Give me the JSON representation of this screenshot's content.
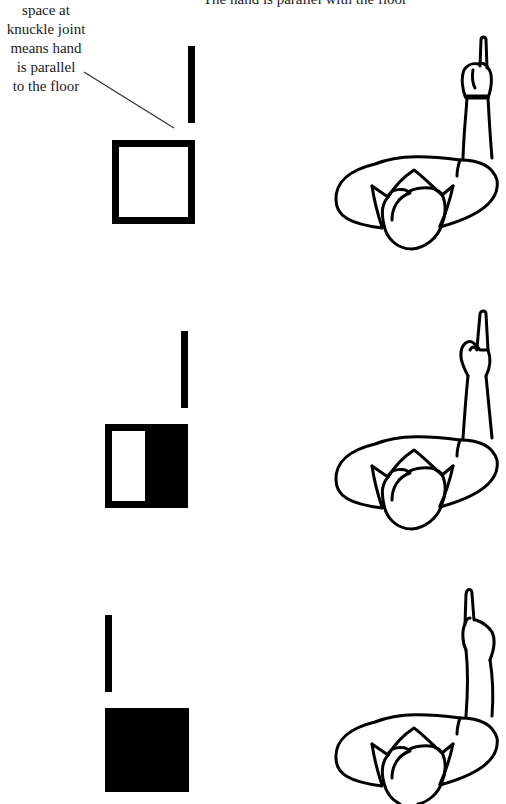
{
  "diagram": {
    "title": "The hand is parallel with the floor",
    "annotation": {
      "lines": [
        "space at",
        "knuckle joint",
        "means hand",
        "is parallel",
        "to the floor"
      ]
    },
    "panels": [
      {
        "id": "panel-1",
        "indicator": {
          "bar_position": "right",
          "square_state": "empty-outline"
        },
        "figure": {
          "pose": "arm raised, index finger pointing up, fist closed",
          "hand_orientation": "parallel to floor"
        }
      },
      {
        "id": "panel-2",
        "indicator": {
          "bar_position": "right",
          "square_state": "half-filled"
        },
        "figure": {
          "pose": "arm raised, index finger pointing up, hand tilted",
          "hand_orientation": "tilted"
        }
      },
      {
        "id": "panel-3",
        "indicator": {
          "bar_position": "left",
          "square_state": "filled"
        },
        "figure": {
          "pose": "arm raised, index finger pointing up, hand bent",
          "hand_orientation": "bent"
        }
      }
    ],
    "colors": {
      "ink": "#000000",
      "background": "#ffffff"
    }
  }
}
